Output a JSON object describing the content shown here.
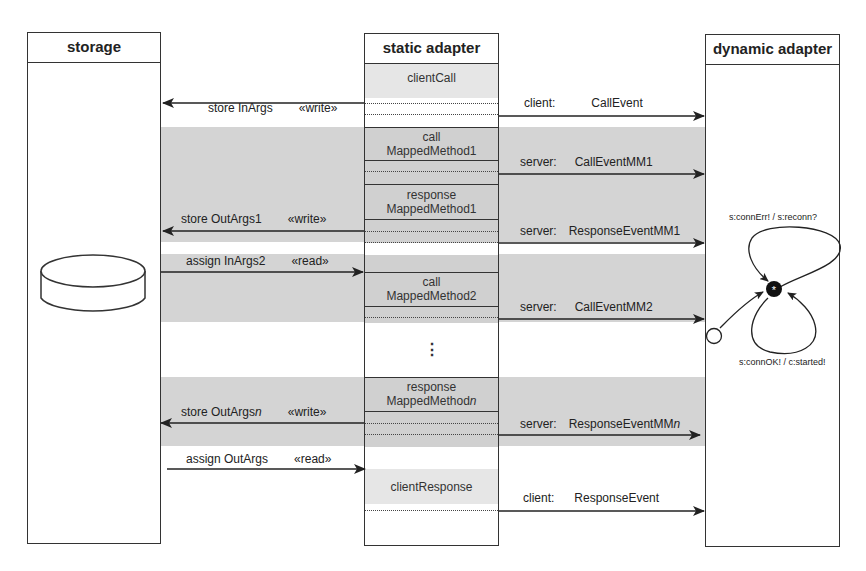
{
  "diagram": {
    "lanes": {
      "storage": {
        "title": "storage"
      },
      "static_adapter": {
        "title": "static adapter"
      },
      "dynamic_adapter": {
        "title": "dynamic adapter"
      }
    },
    "static_segments": {
      "client_call": "clientCall",
      "call_mm1_line1": "call",
      "call_mm1_line2": "MappedMethod1",
      "response_mm1_line1": "response",
      "response_mm1_line2": "MappedMethod1",
      "call_mm2_line1": "call",
      "call_mm2_line2": "MappedMethod2",
      "ellipsis": "⋮",
      "response_mmn_line1": "response",
      "response_mmn_line2_prefix": "MappedMethod",
      "response_mmn_line2_suffix": "n",
      "client_response": "clientResponse"
    },
    "storage_messages": [
      {
        "id": "store-inargs",
        "label": "store InArgs",
        "stereotype": "«write»",
        "direction": "to-storage"
      },
      {
        "id": "store-outargs1",
        "label": "store OutArgs1",
        "stereotype": "«write»",
        "direction": "to-storage"
      },
      {
        "id": "assign-inargs2",
        "label": "assign InArgs2",
        "stereotype": "«read»",
        "direction": "to-static"
      },
      {
        "id": "store-outargsn",
        "label_prefix": "store OutArgs",
        "label_suffix": "n",
        "stereotype": "«write»",
        "direction": "to-storage"
      },
      {
        "id": "assign-outargs",
        "label": "assign OutArgs",
        "stereotype": "«read»",
        "direction": "to-static"
      }
    ],
    "dynamic_messages": [
      {
        "id": "call-event",
        "role": "client:",
        "event": "CallEvent"
      },
      {
        "id": "call-event-mm1",
        "role": "server:",
        "event": "CallEventMM1"
      },
      {
        "id": "response-event-mm1",
        "role": "server:",
        "event": "ResponseEventMM1"
      },
      {
        "id": "call-event-mm2",
        "role": "server:",
        "event": "CallEventMM2"
      },
      {
        "id": "response-event-mmn",
        "role": "server:",
        "event_prefix": "ResponseEventMM",
        "event_suffix": "n"
      },
      {
        "id": "response-event",
        "role": "client:",
        "event": "ResponseEvent"
      }
    ],
    "state_machine": {
      "top_transition": "s:connErr! / s:reconn?",
      "bottom_transition": "s:connOK! / c:started!",
      "state_symbol": "*"
    },
    "colors": {
      "band_gray": "#d4d4d4",
      "light_gray": "#e6e6e6",
      "line": "#333333"
    }
  }
}
